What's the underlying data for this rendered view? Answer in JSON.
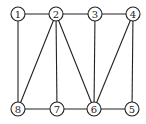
{
  "graph": {
    "nodes": [
      {
        "id": "1",
        "x": 18,
        "y": 14
      },
      {
        "id": "2",
        "x": 56,
        "y": 14
      },
      {
        "id": "3",
        "x": 95,
        "y": 14
      },
      {
        "id": "4",
        "x": 133,
        "y": 14
      },
      {
        "id": "8",
        "x": 18,
        "y": 109
      },
      {
        "id": "7",
        "x": 57,
        "y": 109
      },
      {
        "id": "6",
        "x": 94,
        "y": 109
      },
      {
        "id": "5",
        "x": 132,
        "y": 109
      }
    ],
    "edges": [
      [
        "1",
        "2"
      ],
      [
        "2",
        "3"
      ],
      [
        "3",
        "4"
      ],
      [
        "1",
        "8"
      ],
      [
        "2",
        "8"
      ],
      [
        "2",
        "7"
      ],
      [
        "2",
        "6"
      ],
      [
        "3",
        "6"
      ],
      [
        "4",
        "6"
      ],
      [
        "4",
        "5"
      ],
      [
        "8",
        "7"
      ],
      [
        "7",
        "6"
      ],
      [
        "6",
        "5"
      ]
    ],
    "node_radius": 7
  }
}
